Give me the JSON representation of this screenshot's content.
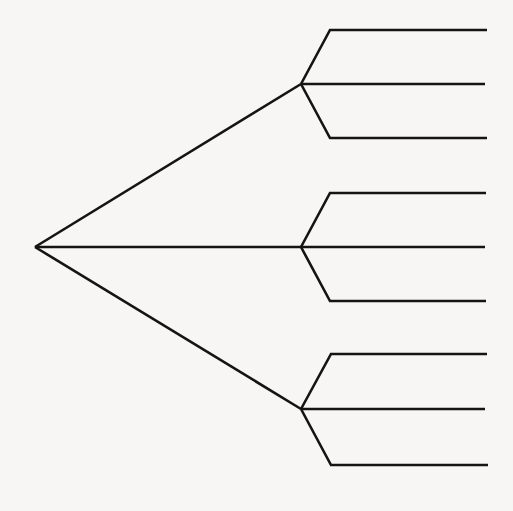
{
  "diagram": {
    "type": "tree",
    "background": "#f7f6f4",
    "line_color": "#141414",
    "line_width": 2.6,
    "root": {
      "id": "root",
      "x": 35,
      "y": 247
    },
    "branches": [
      {
        "id": "branch-1",
        "node": {
          "x": 301,
          "y": 84
        },
        "leaves": [
          {
            "id": "leaf-1-1",
            "corner": {
              "x": 330,
              "y": 30
            },
            "end": {
              "x": 487,
              "y": 30
            }
          },
          {
            "id": "leaf-1-2",
            "corner": {
              "x": 301,
              "y": 84
            },
            "end": {
              "x": 485,
              "y": 84
            }
          },
          {
            "id": "leaf-1-3",
            "corner": {
              "x": 330,
              "y": 138
            },
            "end": {
              "x": 487,
              "y": 138
            }
          }
        ]
      },
      {
        "id": "branch-2",
        "node": {
          "x": 301,
          "y": 247
        },
        "leaves": [
          {
            "id": "leaf-2-1",
            "corner": {
              "x": 330,
              "y": 193
            },
            "end": {
              "x": 486,
              "y": 193
            }
          },
          {
            "id": "leaf-2-2",
            "corner": {
              "x": 301,
              "y": 247
            },
            "end": {
              "x": 485,
              "y": 247
            }
          },
          {
            "id": "leaf-2-3",
            "corner": {
              "x": 330,
              "y": 301
            },
            "end": {
              "x": 486,
              "y": 301
            }
          }
        ]
      },
      {
        "id": "branch-3",
        "node": {
          "x": 301,
          "y": 409
        },
        "leaves": [
          {
            "id": "leaf-3-1",
            "corner": {
              "x": 331,
              "y": 354
            },
            "end": {
              "x": 487,
              "y": 354
            }
          },
          {
            "id": "leaf-3-2",
            "corner": {
              "x": 301,
              "y": 409
            },
            "end": {
              "x": 485,
              "y": 409
            }
          },
          {
            "id": "leaf-3-3",
            "corner": {
              "x": 331,
              "y": 465
            },
            "end": {
              "x": 488,
              "y": 465
            }
          }
        ]
      }
    ]
  }
}
